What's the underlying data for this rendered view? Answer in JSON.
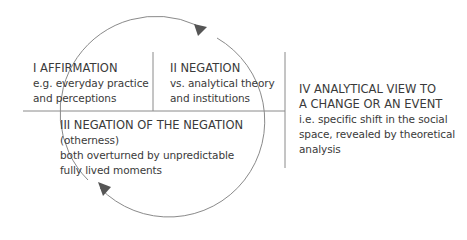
{
  "diagram": {
    "colors": {
      "line": "#8a8a8a",
      "arrow": "#555555",
      "text": "#3a3a3a",
      "background": "#ffffff"
    },
    "quadrants": [
      {
        "id": "I",
        "title": "I AFFIRMATION",
        "lines": [
          "e.g. everyday practice",
          "and perceptions"
        ]
      },
      {
        "id": "II",
        "title": "II NEGATION",
        "lines": [
          "vs. analytical theory",
          "and institutions"
        ]
      },
      {
        "id": "III",
        "title": "III NEGATION OF THE NEGATION",
        "lines": [
          "(otherness)",
          "both overturned by unpredictable",
          "fully lived moments"
        ]
      },
      {
        "id": "IV",
        "title_lines": [
          "IV ANALYTICAL VIEW TO",
          "A CHANGE OR AN EVENT"
        ],
        "lines": [
          "i.e. specific shift in the social",
          "space, revealed by theoretical",
          "analysis"
        ]
      }
    ],
    "cycle": {
      "shape": "circle",
      "direction": "clockwise",
      "arrowheads": [
        "top-right-arrow",
        "bottom-left-arrow"
      ]
    }
  }
}
